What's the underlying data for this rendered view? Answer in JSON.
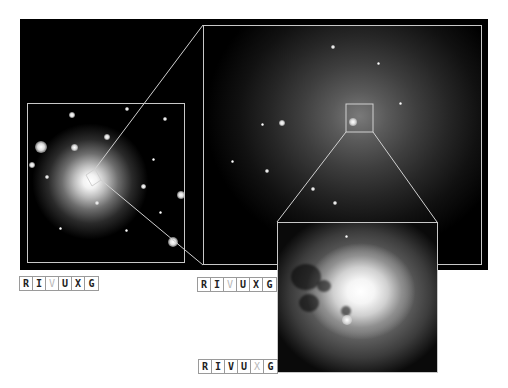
{
  "figure": {
    "background_color": "#000000",
    "frame_color": "#c8c8c8",
    "panels": [
      {
        "id": "wide",
        "label": "wide-field-galaxy-image"
      },
      {
        "id": "mid",
        "label": "galaxy-central-region-image"
      },
      {
        "id": "inset",
        "label": "galaxy-nucleus-closeup-image"
      }
    ]
  },
  "band_labels": [
    {
      "letters": [
        {
          "char": "R",
          "active": true
        },
        {
          "char": "I",
          "active": true
        },
        {
          "char": "V",
          "active": false
        },
        {
          "char": "U",
          "active": true
        },
        {
          "char": "X",
          "active": true
        },
        {
          "char": "G",
          "active": true
        }
      ]
    },
    {
      "letters": [
        {
          "char": "R",
          "active": true
        },
        {
          "char": "I",
          "active": true
        },
        {
          "char": "V",
          "active": false
        },
        {
          "char": "U",
          "active": true
        },
        {
          "char": "X",
          "active": true
        },
        {
          "char": "G",
          "active": true
        }
      ]
    },
    {
      "letters": [
        {
          "char": "R",
          "active": true
        },
        {
          "char": "I",
          "active": true
        },
        {
          "char": "V",
          "active": true
        },
        {
          "char": "U",
          "active": true
        },
        {
          "char": "X",
          "active": false
        },
        {
          "char": "G",
          "active": true
        }
      ]
    }
  ]
}
